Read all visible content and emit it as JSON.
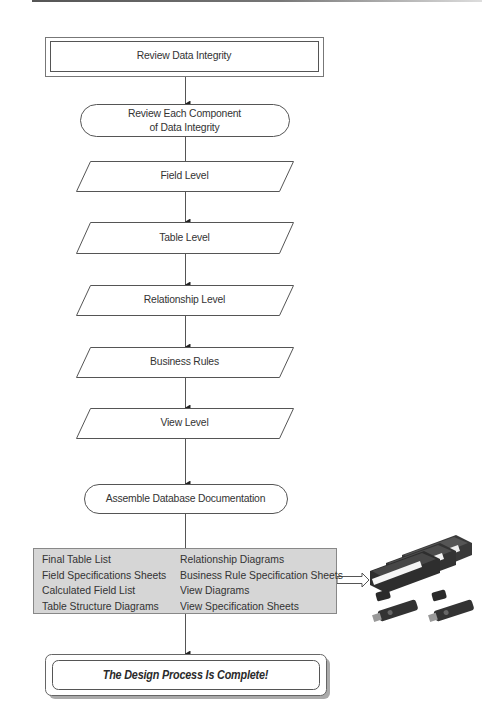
{
  "diagram": {
    "type": "flowchart",
    "colors": {
      "line": "#555555",
      "docs_box_fill": "#d6d6d6",
      "text": "#333333"
    },
    "nodes": {
      "start": {
        "shape": "double-border-rectangle",
        "label": "Review Data Integrity"
      },
      "review_components": {
        "shape": "terminator",
        "line1": "Review Each Component",
        "line2": "of Data Integrity"
      },
      "field_level": {
        "shape": "parallelogram",
        "label": "Field Level"
      },
      "table_level": {
        "shape": "parallelogram",
        "label": "Table Level"
      },
      "relationship_level": {
        "shape": "parallelogram",
        "label": "Relationship Level"
      },
      "business_rules": {
        "shape": "parallelogram",
        "label": "Business Rules"
      },
      "view_level": {
        "shape": "parallelogram",
        "label": "View Level"
      },
      "assemble": {
        "shape": "terminator",
        "label": "Assemble Database Documentation"
      },
      "documentation": {
        "shape": "shaded-rectangle",
        "left_items": [
          "Final Table List",
          "Field Specifications Sheets",
          "Calculated Field List",
          "Table Structure Diagrams"
        ],
        "right_items": [
          "Relationship Diagrams",
          "Business Rule Specification Sheets",
          "View Diagrams",
          "View Specification Sheets"
        ]
      },
      "media_image": {
        "shape": "image",
        "icon": "binders-and-usb-drives-icon"
      },
      "end": {
        "shape": "double-border-rounded-rectangle",
        "label": "The Design Process Is Complete!"
      }
    },
    "edges": [
      {
        "from": "start",
        "to": "review_components",
        "arrowhead": true
      },
      {
        "from": "review_components",
        "to": "field_level",
        "arrowhead": false
      },
      {
        "from": "field_level",
        "to": "table_level",
        "arrowhead": true
      },
      {
        "from": "table_level",
        "to": "relationship_level",
        "arrowhead": true
      },
      {
        "from": "relationship_level",
        "to": "business_rules",
        "arrowhead": true
      },
      {
        "from": "business_rules",
        "to": "view_level",
        "arrowhead": true
      },
      {
        "from": "view_level",
        "to": "assemble",
        "arrowhead": true
      },
      {
        "from": "assemble",
        "to": "documentation",
        "arrowhead": false
      },
      {
        "from": "documentation",
        "to": "media_image",
        "arrowhead": "hollow"
      },
      {
        "from": "documentation",
        "to": "end",
        "arrowhead": true
      }
    ]
  }
}
